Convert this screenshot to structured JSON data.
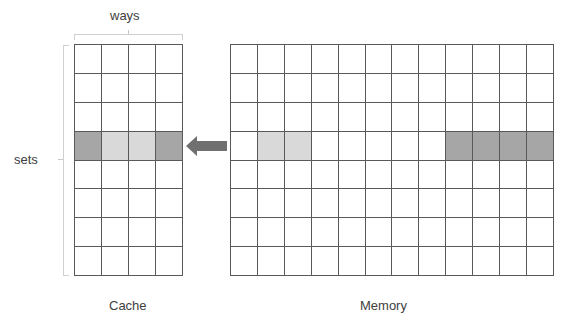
{
  "labels": {
    "ways": "ways",
    "sets": "sets",
    "cache": "Cache",
    "memory": "Memory"
  },
  "colors": {
    "grid_line": "#595959",
    "dark_fill": "#a6a6a6",
    "light_fill": "#d9d9d9",
    "arrow": "#707070",
    "bracket": "#d0d0d0"
  },
  "cache": {
    "rows": 8,
    "cols": 4,
    "highlight_row": 3,
    "highlight_cells": [
      "dark",
      "light",
      "light",
      "dark"
    ]
  },
  "memory": {
    "rows": 8,
    "cols": 12,
    "highlight_row": 3,
    "highlight_cells": [
      "",
      "light",
      "light",
      "",
      "",
      "",
      "",
      "",
      "dark",
      "dark",
      "dark",
      "dark"
    ]
  },
  "arrow": {
    "direction": "left",
    "from": "memory",
    "to": "cache"
  }
}
